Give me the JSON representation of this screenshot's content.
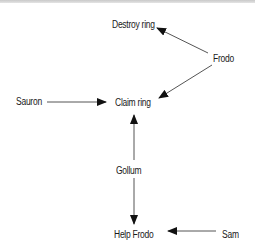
{
  "diagram": {
    "type": "directed-graph",
    "nodes": {
      "destroy_ring": {
        "label": "Destroy ring",
        "x": 112,
        "y": 19
      },
      "frodo": {
        "label": "Frodo",
        "x": 213,
        "y": 53
      },
      "sauron": {
        "label": "Sauron",
        "x": 16,
        "y": 96
      },
      "claim_ring": {
        "label": "Claim ring",
        "x": 115,
        "y": 97
      },
      "gollum": {
        "label": "Gollum",
        "x": 116,
        "y": 165
      },
      "help_frodo": {
        "label": "Help Frodo",
        "x": 114,
        "y": 229
      },
      "sam": {
        "label": "Sam",
        "x": 222,
        "y": 229
      }
    },
    "edges": [
      {
        "from": "Frodo",
        "to": "Destroy ring",
        "x1": 208,
        "y1": 53,
        "x2": 157,
        "y2": 28
      },
      {
        "from": "Frodo",
        "to": "Claim ring",
        "x1": 212,
        "y1": 65,
        "x2": 159,
        "y2": 98
      },
      {
        "from": "Sauron",
        "to": "Claim ring",
        "x1": 47,
        "y1": 102,
        "x2": 106,
        "y2": 102
      },
      {
        "from": "Gollum",
        "to": "Claim ring",
        "x1": 134,
        "y1": 160,
        "x2": 134,
        "y2": 115
      },
      {
        "from": "Gollum",
        "to": "Help Frodo",
        "x1": 134,
        "y1": 178,
        "x2": 134,
        "y2": 224
      },
      {
        "from": "Sam",
        "to": "Help Frodo",
        "x1": 216,
        "y1": 231,
        "x2": 168,
        "y2": 231
      }
    ],
    "colors": {
      "line": "#555555",
      "arrowhead": "#111111",
      "text": "#1a1a1a",
      "top_rule": "#cccccc"
    }
  }
}
